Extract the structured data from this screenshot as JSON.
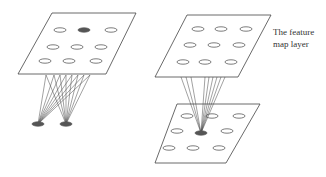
{
  "label": {
    "line1": "The feature",
    "line2": "map layer"
  },
  "colors": {
    "stroke": "#444444",
    "filled": "#555555",
    "background": "#ffffff"
  },
  "left_diagram": {
    "plane": [
      [
        52,
        13
      ],
      [
        136,
        13
      ],
      [
        106,
        74
      ],
      [
        18,
        74
      ]
    ],
    "ellipses": [
      {
        "cx": 60,
        "cy": 30,
        "filled": false
      },
      {
        "cx": 84,
        "cy": 30,
        "filled": true
      },
      {
        "cx": 111,
        "cy": 30,
        "filled": false
      },
      {
        "cx": 53,
        "cy": 47,
        "filled": false
      },
      {
        "cx": 77,
        "cy": 47,
        "filled": false
      },
      {
        "cx": 101,
        "cy": 47,
        "filled": false
      },
      {
        "cx": 45,
        "cy": 61,
        "filled": false
      },
      {
        "cx": 69,
        "cy": 61,
        "filled": false
      },
      {
        "cx": 96,
        "cy": 61,
        "filled": false
      }
    ],
    "bottom_nodes": [
      {
        "cx": 38,
        "cy": 124
      },
      {
        "cx": 66,
        "cy": 124
      }
    ]
  },
  "right_diagram": {
    "top_plane": [
      [
        187,
        15
      ],
      [
        271,
        15
      ],
      [
        238,
        77
      ],
      [
        155,
        77
      ]
    ],
    "top_ellipses": [
      {
        "cx": 198,
        "cy": 29
      },
      {
        "cx": 221,
        "cy": 29
      },
      {
        "cx": 246,
        "cy": 29
      },
      {
        "cx": 190,
        "cy": 45
      },
      {
        "cx": 214,
        "cy": 45
      },
      {
        "cx": 239,
        "cy": 45
      },
      {
        "cx": 183,
        "cy": 62
      },
      {
        "cx": 205,
        "cy": 62
      },
      {
        "cx": 231,
        "cy": 62
      }
    ],
    "bottom_plane": [
      [
        177,
        104
      ],
      [
        260,
        104
      ],
      [
        226,
        163
      ],
      [
        155,
        163
      ]
    ],
    "bottom_ellipses": [
      {
        "cx": 187,
        "cy": 116
      },
      {
        "cx": 212,
        "cy": 116
      },
      {
        "cx": 239,
        "cy": 116
      },
      {
        "cx": 177,
        "cy": 131
      },
      {
        "cx": 227,
        "cy": 131
      },
      {
        "cx": 169,
        "cy": 148
      },
      {
        "cx": 193,
        "cy": 148
      },
      {
        "cx": 219,
        "cy": 148
      }
    ],
    "focus_node": {
      "cx": 201,
      "cy": 133
    }
  }
}
